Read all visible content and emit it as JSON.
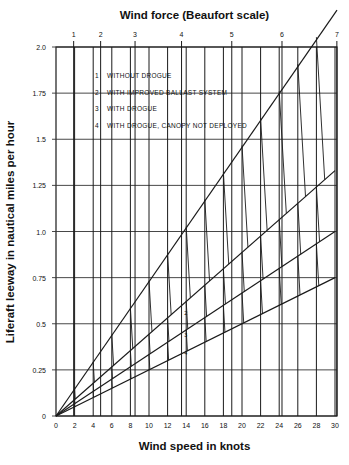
{
  "chart_data": {
    "type": "line",
    "title": "Wind force (Beaufort scale)",
    "xlabel": "Wind speed in knots",
    "ylabel": "Liferaft leeway in nautical miles per hour",
    "xlim": [
      0,
      30
    ],
    "ylim": [
      0,
      2.0
    ],
    "x_ticks": [
      0,
      2,
      4,
      6,
      8,
      10,
      12,
      14,
      16,
      18,
      20,
      22,
      24,
      26,
      28,
      30
    ],
    "y_ticks": [
      0,
      0.25,
      0.5,
      0.75,
      1.0,
      1.25,
      1.5,
      1.75,
      2.0
    ],
    "y_tick_labels": [
      "0",
      "0.25",
      "0.5",
      "0.75",
      "1.0",
      "1.25",
      "1.5",
      "1.75",
      "2.0"
    ],
    "beaufort_ticks": [
      {
        "label": "1",
        "knots": 1.9
      },
      {
        "label": "2",
        "knots": 4.8
      },
      {
        "label": "3",
        "knots": 8.5
      },
      {
        "label": "4",
        "knots": 13.5
      },
      {
        "label": "5",
        "knots": 18.9
      },
      {
        "label": "6",
        "knots": 24.3
      },
      {
        "label": "7",
        "knots": 30.2
      }
    ],
    "grid": true,
    "legend": [
      {
        "id": "1",
        "label": "WITHOUT DROGUE"
      },
      {
        "id": "2",
        "label": "WITH IMPROVED BALLAST SYSTEM"
      },
      {
        "id": "3",
        "label": "WITH DROGUE"
      },
      {
        "id": "4",
        "label": "WITH DROGUE, CANOPY NOT DEPLOYED"
      }
    ],
    "series": [
      {
        "name": "1 WITHOUT DROGUE",
        "x": [
          0,
          30
        ],
        "values": [
          0,
          2.2
        ]
      },
      {
        "name": "2 WITH IMPROVED BALLAST SYSTEM",
        "x": [
          0,
          30
        ],
        "values": [
          0,
          1.33
        ]
      },
      {
        "name": "3 WITH DROGUE",
        "x": [
          0,
          30
        ],
        "values": [
          0,
          1.0
        ]
      },
      {
        "name": "4 WITH DROGUE, CANOPY NOT DEPLOYED",
        "x": [
          0,
          30
        ],
        "values": [
          0,
          0.75
        ]
      }
    ],
    "line_labels_at_14kn": [
      "2",
      "3",
      "4"
    ]
  }
}
